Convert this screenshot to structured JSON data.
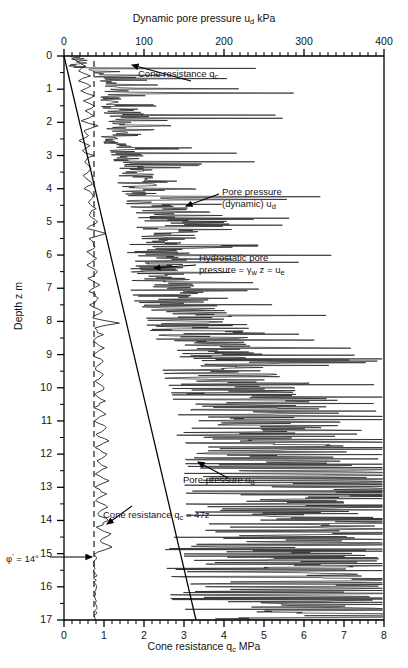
{
  "chart_data": {
    "type": "line",
    "title": "",
    "top_axis": {
      "label": "Dynamic pore pressure u_d kPa",
      "label_plain": "Dynamic pore pressure ud kPa",
      "ticks": [
        0,
        100,
        200,
        300,
        400
      ],
      "range": [
        0,
        400
      ],
      "minor_step": 10,
      "units": "kPa"
    },
    "bottom_axis": {
      "label": "Cone resistance q_c MPa",
      "label_plain": "Cone resistance qc MPa",
      "ticks": [
        0,
        1,
        2,
        3,
        4,
        5,
        6,
        7,
        8
      ],
      "range": [
        0,
        8
      ],
      "minor_step": 0.2,
      "units": "MPa"
    },
    "left_axis": {
      "label": "Depth z m",
      "ticks": [
        0,
        1,
        2,
        3,
        4,
        5,
        6,
        7,
        8,
        9,
        10,
        11,
        12,
        13,
        14,
        15,
        16,
        17
      ],
      "range": [
        0,
        17
      ],
      "minor_step": 0.5,
      "units": "m",
      "direction": "downward"
    },
    "grid": false,
    "legend": "none",
    "series": [
      {
        "name": "Cone resistance qc",
        "axis": "bottom",
        "style": "solid-wiggle",
        "points": [
          [
            0.0,
            0.18
          ],
          [
            0.15,
            0.3
          ],
          [
            0.3,
            0.55
          ],
          [
            0.45,
            0.35
          ],
          [
            0.6,
            0.62
          ],
          [
            0.75,
            0.4
          ],
          [
            0.9,
            0.68
          ],
          [
            1.05,
            0.45
          ],
          [
            1.2,
            0.72
          ],
          [
            1.35,
            0.5
          ],
          [
            1.5,
            0.78
          ],
          [
            1.65,
            0.52
          ],
          [
            1.8,
            0.7
          ],
          [
            1.95,
            0.45
          ],
          [
            2.1,
            0.85
          ],
          [
            2.25,
            0.5
          ],
          [
            2.4,
            0.62
          ],
          [
            2.55,
            0.42
          ],
          [
            2.7,
            0.66
          ],
          [
            2.85,
            0.44
          ],
          [
            3.0,
            0.7
          ],
          [
            3.2,
            0.52
          ],
          [
            3.4,
            0.66
          ],
          [
            3.6,
            0.48
          ],
          [
            3.8,
            0.72
          ],
          [
            4.0,
            0.55
          ],
          [
            4.2,
            0.74
          ],
          [
            4.4,
            0.58
          ],
          [
            4.6,
            0.8
          ],
          [
            4.8,
            0.6
          ],
          [
            5.0,
            0.82
          ],
          [
            5.2,
            0.58
          ],
          [
            5.35,
            1.05
          ],
          [
            5.5,
            0.62
          ],
          [
            5.7,
            0.8
          ],
          [
            5.9,
            0.6
          ],
          [
            6.1,
            0.84
          ],
          [
            6.3,
            0.62
          ],
          [
            6.5,
            0.86
          ],
          [
            6.7,
            0.64
          ],
          [
            6.9,
            0.88
          ],
          [
            7.1,
            0.66
          ],
          [
            7.3,
            0.9
          ],
          [
            7.5,
            0.68
          ],
          [
            7.7,
            0.95
          ],
          [
            7.9,
            0.7
          ],
          [
            8.05,
            1.35
          ],
          [
            8.2,
            0.72
          ],
          [
            8.4,
            0.95
          ],
          [
            8.6,
            0.7
          ],
          [
            8.8,
            0.98
          ],
          [
            9.0,
            0.72
          ],
          [
            9.2,
            1.0
          ],
          [
            9.4,
            0.74
          ],
          [
            9.6,
            1.02
          ],
          [
            9.8,
            0.76
          ],
          [
            10.0,
            1.05
          ],
          [
            10.2,
            0.78
          ],
          [
            10.4,
            1.0
          ],
          [
            10.6,
            0.76
          ],
          [
            10.8,
            1.02
          ],
          [
            11.0,
            0.78
          ],
          [
            11.2,
            1.05
          ],
          [
            11.4,
            0.8
          ],
          [
            11.6,
            1.08
          ],
          [
            11.8,
            0.8
          ],
          [
            12.0,
            1.1
          ],
          [
            12.2,
            0.82
          ],
          [
            12.4,
            1.06
          ],
          [
            12.6,
            0.8
          ],
          [
            12.8,
            1.08
          ],
          [
            13.0,
            0.82
          ],
          [
            13.2,
            1.05
          ],
          [
            13.4,
            0.8
          ],
          [
            13.6,
            1.1
          ],
          [
            13.8,
            0.82
          ],
          [
            14.0,
            1.12
          ],
          [
            14.2,
            0.84
          ],
          [
            14.4,
            1.15
          ],
          [
            14.6,
            0.86
          ],
          [
            14.8,
            1.2
          ],
          [
            14.95,
            0.8
          ],
          [
            15.1,
            0.78
          ],
          [
            15.3,
            0.76
          ],
          [
            15.6,
            0.78
          ],
          [
            16.0,
            0.77
          ],
          [
            16.5,
            0.78
          ],
          [
            17.0,
            0.8
          ]
        ]
      },
      {
        "name": "Pore pressure (dynamic) ud",
        "axis": "top",
        "style": "solid-spiky",
        "description": "Highly variable dynamic pore pressure increasing with depth, spiking to 300-400 kPa below 9 m"
      },
      {
        "name": "Cone resistance qc = 47z",
        "axis": "bottom",
        "style": "solid-straight-line",
        "equation": "qc = 47z",
        "endpoints": [
          [
            0,
            0.0
          ],
          [
            17,
            3.3
          ]
        ]
      },
      {
        "name": "Hydrostatic pore pressure ue",
        "axis": "bottom",
        "style": "dashed-vertical",
        "equation": "ue = gamma_w z",
        "value_mpa": 0.75
      }
    ],
    "annotations": [
      {
        "id": "cone-resistance-top",
        "text": "Cone resistance q_c",
        "text_plain": "Cone resistance qc"
      },
      {
        "id": "pore-pressure-dynamic",
        "line1": "Pore pressure",
        "line2": "(dynamic) u_d"
      },
      {
        "id": "hydrostatic",
        "line1": "Hydrostatic pore",
        "line2": "pressure = γ_w z = u_e"
      },
      {
        "id": "pore-pressure-ud",
        "text": "Pore pressure u_d"
      },
      {
        "id": "cone-resistance-47z",
        "text": "Cone resistance q_c = 47z"
      },
      {
        "id": "phi-prime",
        "text": "φ' = 14°",
        "depth_m": 15.3
      }
    ],
    "colors": {
      "axis": "#000000",
      "trace": "#1a1a1a",
      "background": "#ffffff"
    }
  },
  "top_axis_title": {
    "a": "Dynamic pore pressure u",
    "sub": "d",
    "b": " kPa"
  },
  "bottom_axis_title": {
    "a": "Cone resistance q",
    "sub": "c",
    "b": " MPa"
  },
  "y_axis_title": "Depth z m",
  "top_ticks": [
    "0",
    "100",
    "200",
    "300",
    "400"
  ],
  "bottom_ticks": [
    "0",
    "1",
    "2",
    "3",
    "4",
    "5",
    "6",
    "7",
    "8"
  ],
  "depth_ticks": [
    "0",
    "1",
    "2",
    "3",
    "4",
    "5",
    "6",
    "7",
    "8",
    "9",
    "10",
    "11",
    "12",
    "13",
    "14",
    "15",
    "16",
    "17"
  ],
  "annot": {
    "cone_top": {
      "a": "Cone resistance q",
      "sub": "c"
    },
    "pore_dyn_l1": "Pore pressure",
    "pore_dyn_l2a": "(dynamic) u",
    "pore_dyn_l2sub": "d",
    "hydro_l1": "Hydrostatic pore",
    "hydro_l2a": "pressure = γ",
    "hydro_l2sub1": "w",
    "hydro_l2b": " z = u",
    "hydro_l2sub2": "e",
    "pore_ud_a": "Pore pressure u",
    "pore_ud_sub": "d",
    "cone_47z_a": "Cone resistance q",
    "cone_47z_sub": "c",
    "cone_47z_b": " = 47z",
    "phi_a": "φ",
    "phi_sup": "'",
    "phi_b": " = 14°"
  }
}
